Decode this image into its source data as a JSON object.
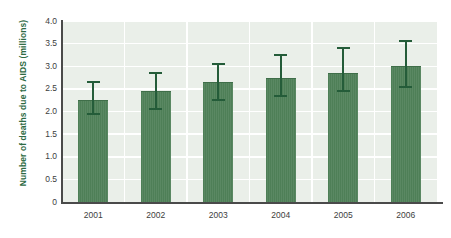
{
  "chart_data": {
    "type": "bar",
    "title": "",
    "xlabel": "",
    "ylabel": "Number of deaths due to AIDS (millions)",
    "categories": [
      "2001",
      "2002",
      "2003",
      "2004",
      "2005",
      "2006"
    ],
    "values": [
      2.25,
      2.45,
      2.65,
      2.75,
      2.85,
      3.0
    ],
    "error_low": [
      1.95,
      2.05,
      2.25,
      2.35,
      2.45,
      2.55
    ],
    "error_high": [
      2.65,
      2.85,
      3.05,
      3.25,
      3.4,
      3.55
    ],
    "ylim": [
      0,
      4.0
    ],
    "yticks": [
      "0",
      "0.5",
      "1.0",
      "1.5",
      "2.0",
      "2.5",
      "3.0",
      "3.5",
      "4.0"
    ],
    "ytick_values": [
      0,
      0.5,
      1.0,
      1.5,
      2.0,
      2.5,
      3.0,
      3.5,
      4.0
    ],
    "grid": true,
    "legend": "none",
    "series": [
      {
        "name": "Number of deaths due to AIDS (millions)",
        "values": [
          2.25,
          2.45,
          2.65,
          2.75,
          2.85,
          3.0
        ]
      }
    ],
    "colors": {
      "bar": "#4e7f57",
      "error_bar": "#245c39",
      "plot_background": "#eaefe9",
      "gridline": "#ffffff",
      "axis": "#4a4a4a",
      "axis_label": "#2e6b44",
      "tick_label": "#3d3d3d"
    }
  }
}
